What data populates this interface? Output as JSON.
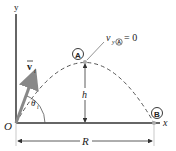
{
  "diagram": {
    "axes": {
      "x_label": "x",
      "y_label": "y",
      "origin_label": "O"
    },
    "initial_velocity": {
      "label": "v",
      "subscript": "i",
      "angle_label": "θ",
      "angle_subscript": "i"
    },
    "points": [
      {
        "id": "A",
        "label": "A",
        "description": "peak of trajectory"
      },
      {
        "id": "B",
        "label": "B",
        "description": "landing point"
      }
    ],
    "annotation": {
      "text_v": "v",
      "text_sub": "y",
      "text_point": "A",
      "text_eq": "= 0"
    },
    "dimensions": {
      "height_label": "h",
      "range_label": "R"
    },
    "colors": {
      "axis": "#333333",
      "trajectory": "#555555",
      "vector": "#888888",
      "text": "#222222"
    }
  }
}
